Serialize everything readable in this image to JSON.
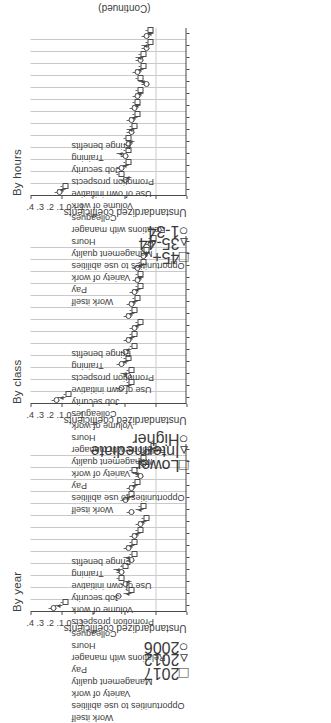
{
  "figure": {
    "continued_note": "(Continued)",
    "axis_title": "Unstandardized coefficients",
    "tick_labels": [
      "-.1",
      "0",
      ".1",
      ".2",
      ".3",
      ".4"
    ],
    "axis_min": -0.1,
    "axis_max": 0.4
  },
  "chart_data": [
    {
      "type": "scatter",
      "title": "By year",
      "xlabel": "Unstandardized coefficients",
      "ylabel": "",
      "xlim": [
        -0.1,
        0.4
      ],
      "grid": true,
      "legend_position": "below-right",
      "tick_labels": [
        "-.1",
        "0",
        ".1",
        ".2",
        ".3",
        ".4"
      ],
      "categories": [
        "Work itself",
        "Opportunities to use abilities",
        "Variety of work",
        "Management quality",
        "Pay",
        "Relations with manager",
        "Hours",
        "Colleagues",
        "Promotion prospects",
        "Volume of work",
        "Job security",
        "Use of own initiative",
        "Training",
        "Fringe benefits"
      ],
      "series": [
        {
          "name": "2006",
          "marker": "circle",
          "values": [
            0.33,
            0.12,
            0.1,
            0.11,
            0.08,
            0.09,
            0.07,
            0.05,
            0.08,
            0.1,
            0.08,
            0.05,
            0.04,
            0.03
          ]
        },
        {
          "name": "2012",
          "marker": "triangle",
          "values": [
            0.31,
            0.09,
            0.09,
            0.12,
            0.09,
            0.08,
            0.06,
            0.04,
            0.05,
            0.09,
            0.07,
            0.06,
            0.05,
            0.02
          ]
        },
        {
          "name": "2017",
          "marker": "square",
          "values": [
            0.29,
            0.08,
            0.11,
            0.1,
            0.07,
            0.07,
            0.05,
            0.03,
            0.04,
            0.08,
            0.06,
            0.07,
            0.04,
            0.01
          ]
        }
      ]
    },
    {
      "type": "scatter",
      "title": "By class",
      "xlabel": "Unstandardized coefficients",
      "ylabel": "",
      "xlim": [
        -0.1,
        0.4
      ],
      "grid": true,
      "legend_position": "below-right",
      "tick_labels": [
        "-.1",
        "0",
        ".1",
        ".2",
        ".3",
        ".4"
      ],
      "categories": [
        "Work itself",
        "Opportunities to use abilities",
        "Pay",
        "Variety of work",
        "Management quality",
        "Relations with manager",
        "Hours",
        "Volume of work",
        "Colleagues",
        "Job security",
        "Use of own initiative",
        "Promotion prospects",
        "Training",
        "Fringe benefits"
      ],
      "series": [
        {
          "name": "Higher",
          "marker": "circle",
          "values": [
            0.32,
            0.11,
            0.09,
            0.11,
            0.1,
            0.09,
            0.07,
            0.09,
            0.08,
            0.07,
            0.06,
            0.06,
            0.04,
            0.02
          ]
        },
        {
          "name": "Intermediate",
          "marker": "triangle",
          "values": [
            0.3,
            0.09,
            0.1,
            0.1,
            0.09,
            0.08,
            0.06,
            0.08,
            0.07,
            0.06,
            0.05,
            0.05,
            0.03,
            0.02
          ]
        },
        {
          "name": "Lower",
          "marker": "square",
          "values": [
            0.28,
            0.08,
            0.08,
            0.09,
            0.07,
            0.07,
            0.05,
            0.07,
            0.06,
            0.05,
            0.05,
            0.04,
            0.03,
            0.01
          ]
        }
      ]
    },
    {
      "type": "scatter",
      "title": "By hours",
      "xlabel": "Unstandardized coefficients",
      "ylabel": "",
      "xlim": [
        -0.1,
        0.4
      ],
      "grid": true,
      "legend_position": "below-right",
      "tick_labels": [
        "-.1",
        "0",
        ".1",
        ".2",
        ".3",
        ".4"
      ],
      "categories": [
        "Work itself",
        "Pay",
        "Variety of work",
        "Opportunities to use abilities",
        "Management quality",
        "Hours",
        "Relations with manager",
        "Colleagues",
        "Volume of work",
        "Use of own initiative",
        "Promotion prospects",
        "Job security",
        "Training",
        "Fringe benefits"
      ],
      "series": [
        {
          "name": "1-34",
          "marker": "circle",
          "values": [
            0.31,
            0.1,
            0.11,
            0.1,
            0.09,
            0.08,
            0.08,
            0.07,
            0.06,
            0.03,
            0.06,
            0.05,
            0.03,
            0.03
          ]
        },
        {
          "name": "35-44",
          "marker": "triangle",
          "values": [
            0.3,
            0.09,
            0.1,
            0.11,
            0.08,
            0.08,
            0.07,
            0.06,
            0.05,
            0.04,
            0.05,
            0.05,
            0.03,
            0.02
          ]
        },
        {
          "name": "45+",
          "marker": "square",
          "values": [
            0.29,
            0.11,
            0.09,
            0.09,
            0.09,
            0.07,
            0.06,
            0.06,
            0.05,
            0.05,
            0.04,
            0.04,
            0.02,
            0.02
          ]
        }
      ]
    }
  ]
}
